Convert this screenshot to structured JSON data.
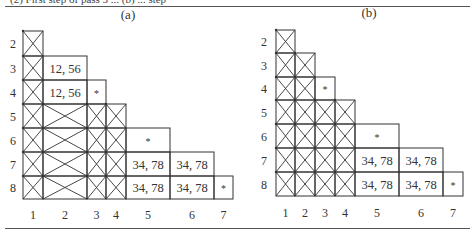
{
  "caption_cut": "(2) First step of pass 3 ... (b) ... step",
  "panels": [
    {
      "id": "a",
      "title": "(a)",
      "title_pos": [
        128,
        19
      ],
      "col_edges": [
        23,
        43,
        87,
        106,
        126,
        170,
        214,
        233
      ],
      "row_edges": [
        31,
        56,
        80,
        104,
        128,
        152,
        176,
        199
      ],
      "row_label_x": 13,
      "col_label_y": 219,
      "row_labels": [
        "2",
        "3",
        "4",
        "5",
        "6",
        "7",
        "8"
      ],
      "col_labels": [
        "1",
        "2",
        "3",
        "4",
        "5",
        "6",
        "7"
      ],
      "cells": [
        {
          "r": 0,
          "c": 0,
          "type": "x"
        },
        {
          "r": 1,
          "c": 0,
          "type": "x"
        },
        {
          "r": 1,
          "c": 1,
          "type": "text",
          "text": "12,  56"
        },
        {
          "r": 2,
          "c": 0,
          "type": "x"
        },
        {
          "r": 2,
          "c": 1,
          "type": "text",
          "text": "12,  56"
        },
        {
          "r": 2,
          "c": 2,
          "type": "text",
          "text": "*"
        },
        {
          "r": 3,
          "c": 0,
          "type": "x"
        },
        {
          "r": 3,
          "c": 1,
          "type": "x"
        },
        {
          "r": 3,
          "c": 2,
          "type": "x"
        },
        {
          "r": 3,
          "c": 3,
          "type": "x"
        },
        {
          "r": 4,
          "c": 0,
          "type": "x"
        },
        {
          "r": 4,
          "c": 1,
          "type": "x"
        },
        {
          "r": 4,
          "c": 2,
          "type": "x"
        },
        {
          "r": 4,
          "c": 3,
          "type": "x"
        },
        {
          "r": 4,
          "c": 4,
          "type": "text",
          "text": "*"
        },
        {
          "r": 5,
          "c": 0,
          "type": "x"
        },
        {
          "r": 5,
          "c": 1,
          "type": "x"
        },
        {
          "r": 5,
          "c": 2,
          "type": "x"
        },
        {
          "r": 5,
          "c": 3,
          "type": "x"
        },
        {
          "r": 5,
          "c": 4,
          "type": "text",
          "text": "34,  78"
        },
        {
          "r": 5,
          "c": 5,
          "type": "text",
          "text": "34,  78"
        },
        {
          "r": 6,
          "c": 0,
          "type": "x"
        },
        {
          "r": 6,
          "c": 1,
          "type": "x"
        },
        {
          "r": 6,
          "c": 2,
          "type": "x"
        },
        {
          "r": 6,
          "c": 3,
          "type": "x"
        },
        {
          "r": 6,
          "c": 4,
          "type": "text",
          "text": "34,  78"
        },
        {
          "r": 6,
          "c": 5,
          "type": "text",
          "text": "34,  78"
        },
        {
          "r": 6,
          "c": 6,
          "type": "text",
          "text": "*"
        }
      ]
    },
    {
      "id": "b",
      "title": "(b)",
      "title_pos": [
        369,
        17
      ],
      "col_edges": [
        276,
        295,
        315,
        335,
        355,
        399,
        443,
        463
      ],
      "row_edges": [
        30,
        53,
        77,
        100,
        124,
        148,
        172,
        196
      ],
      "row_label_x": 264,
      "col_label_y": 217,
      "row_labels": [
        "2",
        "3",
        "4",
        "5",
        "6",
        "7",
        "8"
      ],
      "col_labels": [
        "1",
        "2",
        "3",
        "4",
        "5",
        "6",
        "7"
      ],
      "cells": [
        {
          "r": 0,
          "c": 0,
          "type": "x"
        },
        {
          "r": 1,
          "c": 0,
          "type": "x"
        },
        {
          "r": 1,
          "c": 1,
          "type": "x"
        },
        {
          "r": 2,
          "c": 0,
          "type": "x"
        },
        {
          "r": 2,
          "c": 1,
          "type": "x"
        },
        {
          "r": 2,
          "c": 2,
          "type": "text",
          "text": "*"
        },
        {
          "r": 3,
          "c": 0,
          "type": "x"
        },
        {
          "r": 3,
          "c": 1,
          "type": "x"
        },
        {
          "r": 3,
          "c": 2,
          "type": "x"
        },
        {
          "r": 3,
          "c": 3,
          "type": "x"
        },
        {
          "r": 4,
          "c": 0,
          "type": "x"
        },
        {
          "r": 4,
          "c": 1,
          "type": "x"
        },
        {
          "r": 4,
          "c": 2,
          "type": "x"
        },
        {
          "r": 4,
          "c": 3,
          "type": "x"
        },
        {
          "r": 4,
          "c": 4,
          "type": "text",
          "text": "*"
        },
        {
          "r": 5,
          "c": 0,
          "type": "x"
        },
        {
          "r": 5,
          "c": 1,
          "type": "x"
        },
        {
          "r": 5,
          "c": 2,
          "type": "x"
        },
        {
          "r": 5,
          "c": 3,
          "type": "x"
        },
        {
          "r": 5,
          "c": 4,
          "type": "text",
          "text": "34,  78"
        },
        {
          "r": 5,
          "c": 5,
          "type": "text",
          "text": "34,  78"
        },
        {
          "r": 6,
          "c": 0,
          "type": "x"
        },
        {
          "r": 6,
          "c": 1,
          "type": "x"
        },
        {
          "r": 6,
          "c": 2,
          "type": "x"
        },
        {
          "r": 6,
          "c": 3,
          "type": "x"
        },
        {
          "r": 6,
          "c": 4,
          "type": "text",
          "text": "34,  78"
        },
        {
          "r": 6,
          "c": 5,
          "type": "text",
          "text": "34,  78"
        },
        {
          "r": 6,
          "c": 6,
          "type": "text",
          "text": "*"
        }
      ]
    }
  ],
  "colors": {
    "line": "#333333",
    "text": "#333333",
    "rule": "#555555",
    "background": "#ffffff"
  }
}
